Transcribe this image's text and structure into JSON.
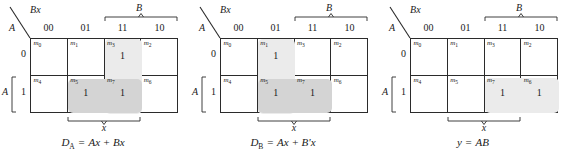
{
  "figure": {
    "map_count": 3
  },
  "common": {
    "corner_top_label": "Bx",
    "corner_bottom_label": "A",
    "column_group_label": "B",
    "column_headers": [
      "00",
      "01",
      "11",
      "10"
    ],
    "row_labels": [
      "0",
      "1"
    ],
    "row_group_label": "A",
    "bottom_group_label": "x",
    "one_value": "1",
    "minterm_order_top": [
      "m",
      "m",
      "m",
      "m"
    ],
    "minterm_indices_top": [
      "0",
      "1",
      "3",
      "2"
    ],
    "minterm_indices_bottom": [
      "4",
      "5",
      "7",
      "6"
    ],
    "colors": {
      "grid_line": "#2b2b2b",
      "group_light": "#ebebeb",
      "group_dark": "#d4d4d4",
      "text": "#1a1a1a",
      "background": "#ffffff"
    }
  },
  "maps": [
    {
      "id": "map-da",
      "name": "D_A map",
      "cells": [
        {
          "minterm": "m",
          "index": "0",
          "value": ""
        },
        {
          "minterm": "m",
          "index": "1",
          "value": ""
        },
        {
          "minterm": "m",
          "index": "3",
          "value": "1"
        },
        {
          "minterm": "m",
          "index": "2",
          "value": ""
        },
        {
          "minterm": "m",
          "index": "4",
          "value": ""
        },
        {
          "minterm": "m",
          "index": "5",
          "value": "1"
        },
        {
          "minterm": "m",
          "index": "7",
          "value": "1"
        },
        {
          "minterm": "m",
          "index": "6",
          "value": ""
        }
      ],
      "groups": [
        {
          "label": "Bx-group-col-11",
          "shade": "light",
          "left": 74,
          "top": 0,
          "width": 37,
          "height": 75
        },
        {
          "label": "Ax-group-row-1",
          "shade": "dark",
          "left": 37,
          "top": 40,
          "width": 74,
          "height": 34
        }
      ],
      "formula": {
        "lhs": "D",
        "lhs_sub": "A",
        "rhs": "Ax + Bx",
        "full": "D_A = Ax + Bx"
      }
    },
    {
      "id": "map-db",
      "name": "D_B map",
      "cells": [
        {
          "minterm": "m",
          "index": "0",
          "value": ""
        },
        {
          "minterm": "m",
          "index": "1",
          "value": "1"
        },
        {
          "minterm": "m",
          "index": "3",
          "value": ""
        },
        {
          "minterm": "m",
          "index": "2",
          "value": ""
        },
        {
          "minterm": "m",
          "index": "4",
          "value": ""
        },
        {
          "minterm": "m",
          "index": "5",
          "value": "1"
        },
        {
          "minterm": "m",
          "index": "7",
          "value": "1"
        },
        {
          "minterm": "m",
          "index": "6",
          "value": ""
        }
      ],
      "groups": [
        {
          "label": "B'x-group-col-01",
          "shade": "light",
          "left": 37,
          "top": 0,
          "width": 37,
          "height": 75
        },
        {
          "label": "Ax-group-row-1",
          "shade": "dark",
          "left": 37,
          "top": 40,
          "width": 74,
          "height": 34
        }
      ],
      "formula": {
        "lhs": "D",
        "lhs_sub": "B",
        "rhs": "Ax + B'x",
        "full": "D_B = Ax + B'x"
      }
    },
    {
      "id": "map-y",
      "name": "y output map",
      "cells": [
        {
          "minterm": "m",
          "index": "0",
          "value": ""
        },
        {
          "minterm": "m",
          "index": "1",
          "value": ""
        },
        {
          "minterm": "m",
          "index": "3",
          "value": ""
        },
        {
          "minterm": "m",
          "index": "2",
          "value": ""
        },
        {
          "minterm": "m",
          "index": "4",
          "value": ""
        },
        {
          "minterm": "m",
          "index": "5",
          "value": ""
        },
        {
          "minterm": "m",
          "index": "7",
          "value": "1"
        },
        {
          "minterm": "m",
          "index": "6",
          "value": "1"
        }
      ],
      "groups": [
        {
          "label": "AB-group-row-1-cols-11-10",
          "shade": "light",
          "left": 74,
          "top": 39,
          "width": 74,
          "height": 35
        }
      ],
      "formula": {
        "lhs": "y",
        "lhs_sub": "",
        "rhs": "AB",
        "full": "y = AB"
      }
    }
  ]
}
